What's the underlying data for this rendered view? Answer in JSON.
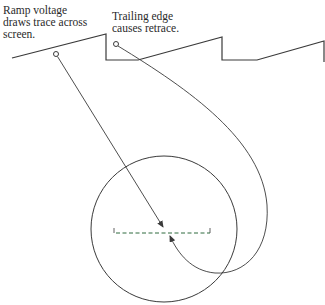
{
  "labels": {
    "ramp": "Ramp voltage\ndraws trace across\nscreen.",
    "trailing": "Trailing edge\ncauses retrace."
  },
  "colors": {
    "line": "#3a3a3a",
    "trace_forward": "#59c98a",
    "trace_forward_end": "#5ab8e6",
    "trace_retrace": "#2e6b3e",
    "background": "#ffffff"
  },
  "diagram": {
    "sawtooth_waveform": "ramp rises, trailing edge drops, flat segment, repeats (3 cycles)",
    "screen_circle": {
      "cx": 164,
      "cy": 229,
      "r": 73
    },
    "trace_line": "horizontal forward trace (solid) with retrace (dashed) beneath",
    "pointers": [
      "ramp marker -> forward trace arrow",
      "trailing edge marker -> looping retrace arrow"
    ]
  }
}
